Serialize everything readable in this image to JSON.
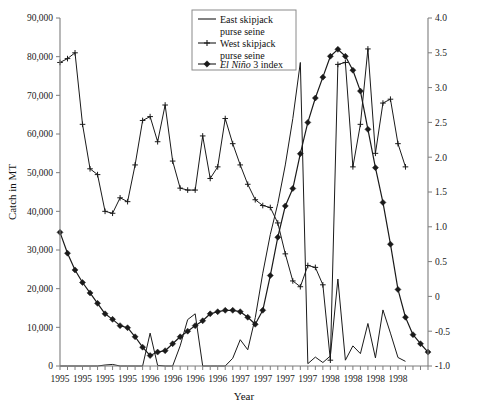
{
  "chart_data": {
    "type": "line",
    "title": "",
    "xlabel": "Year",
    "ylabel": "Catch in MT",
    "y2label": "",
    "ylim": [
      0,
      90000
    ],
    "y2lim": [
      -1.0,
      4.0
    ],
    "grid": false,
    "legend_position": "top-center",
    "y_ticks": [
      "0",
      "10,000",
      "20,000",
      "30,000",
      "40,000",
      "50,000",
      "60,000",
      "70,000",
      "80,000",
      "90,000"
    ],
    "y2_ticks": [
      "-1.0",
      "-0.5",
      "0",
      "0.5",
      "1.0",
      "1.5",
      "2.0",
      "2.5",
      "3.0",
      "3.5",
      "4.0"
    ],
    "x_tick_labels": [
      "1995",
      "1995",
      "1995",
      "1995",
      "1996",
      "1996",
      "1996",
      "1996",
      "1997",
      "1997",
      "1997",
      "1997",
      "1998",
      "1998",
      "1998",
      "1998"
    ],
    "x_label_every_n_points": 3,
    "n_points": 47,
    "series": [
      {
        "name": "East skipjack purse seine",
        "axis": "left",
        "marker": "none",
        "values": [
          0,
          0,
          0,
          0,
          0,
          0,
          250,
          400,
          0,
          0,
          0,
          0,
          8500,
          150,
          0,
          0,
          5200,
          12000,
          13500,
          0,
          0,
          0,
          0,
          2000,
          6800,
          4200,
          12500,
          24000,
          34000,
          42000,
          52000,
          64000,
          78500,
          600,
          2300,
          900,
          2600,
          22500,
          1500,
          5200,
          3200,
          11000,
          2100,
          14500,
          8500,
          2200,
          1200
        ]
      },
      {
        "name": "West skipjack purse seine",
        "axis": "left",
        "marker": "plus",
        "values": [
          78500,
          79500,
          81000,
          62500,
          51000,
          49500,
          40000,
          39500,
          43500,
          42500,
          52000,
          63500,
          64500,
          58000,
          67500,
          53000,
          46000,
          45500,
          45500,
          59500,
          48500,
          51500,
          64000,
          57500,
          52000,
          47000,
          43000,
          41500,
          41000,
          37000,
          29000,
          22000,
          20500,
          26000,
          25500,
          21000,
          1500,
          78000,
          78500,
          51500,
          62500,
          82000,
          55000,
          68000,
          69000,
          57500,
          51500
        ]
      },
      {
        "name": "El Niño 3 index",
        "axis": "right",
        "marker": "diamond",
        "values": [
          0.92,
          0.62,
          0.38,
          0.2,
          0.05,
          -0.1,
          -0.25,
          -0.33,
          -0.42,
          -0.45,
          -0.58,
          -0.73,
          -0.85,
          -0.8,
          -0.78,
          -0.68,
          -0.58,
          -0.5,
          -0.42,
          -0.35,
          -0.25,
          -0.22,
          -0.2,
          -0.2,
          -0.22,
          -0.3,
          -0.4,
          -0.2,
          0.3,
          0.85,
          1.3,
          1.55,
          2.05,
          2.5,
          2.85,
          3.15,
          3.45,
          3.55,
          3.45,
          3.25,
          2.95,
          2.4,
          1.85,
          1.35,
          0.75,
          0.1,
          -0.3,
          -0.55,
          -0.68,
          -0.8
        ]
      }
    ]
  },
  "legend": {
    "items": [
      {
        "label_line1": "East skipjack",
        "label_line2": "purse seine",
        "marker": "line"
      },
      {
        "label_line1": "West skipjack",
        "label_line2": "purse seine",
        "marker": "plus"
      },
      {
        "label_italic": "El Niño",
        "label_rest": " 3 index",
        "marker": "diamond"
      }
    ]
  },
  "axes": {
    "y_title": "Catch in MT",
    "x_title": "Year"
  }
}
